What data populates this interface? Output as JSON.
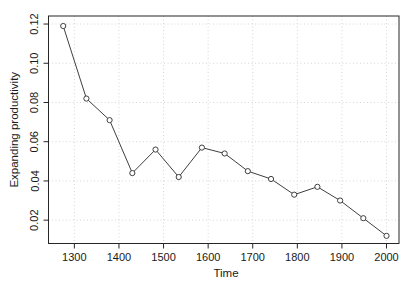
{
  "chart_data": {
    "type": "line",
    "title": "",
    "xlabel": "Time",
    "ylabel": "Expanding productivity",
    "x": [
      1275,
      1327,
      1379,
      1430,
      1482,
      1534,
      1586,
      1637,
      1689,
      1741,
      1793,
      1845,
      1896,
      1948,
      2000
    ],
    "y": [
      0.119,
      0.082,
      0.071,
      0.044,
      0.056,
      0.042,
      0.057,
      0.054,
      0.045,
      0.041,
      0.033,
      0.037,
      0.03,
      0.021,
      0.012
    ],
    "xlim": [
      1242,
      2028
    ],
    "ylim": [
      0.0081,
      0.1241
    ],
    "x_tick_values": [
      1300,
      1400,
      1500,
      1600,
      1700,
      1800,
      1900,
      2000
    ],
    "x_tick_labels": [
      "1300",
      "1400",
      "1500",
      "1600",
      "1700",
      "1800",
      "1900",
      "2000"
    ],
    "y_tick_values": [
      0.02,
      0.04,
      0.06,
      0.08,
      0.1,
      0.12
    ],
    "y_tick_labels": [
      "0.02",
      "0.04",
      "0.06",
      "0.08",
      "0.10",
      "0.12"
    ],
    "grid": "dotted-both-axes",
    "legend": "none",
    "marker": "open-circle",
    "colors": {
      "background": "#ffffff",
      "line": "#3f3f3f",
      "marker_stroke": "#3f3f3f",
      "marker_fill": "#ffffff",
      "grid": "#d6d6d6",
      "box": "#262626",
      "tick": "#262626",
      "text": "#1a1a1a"
    }
  }
}
